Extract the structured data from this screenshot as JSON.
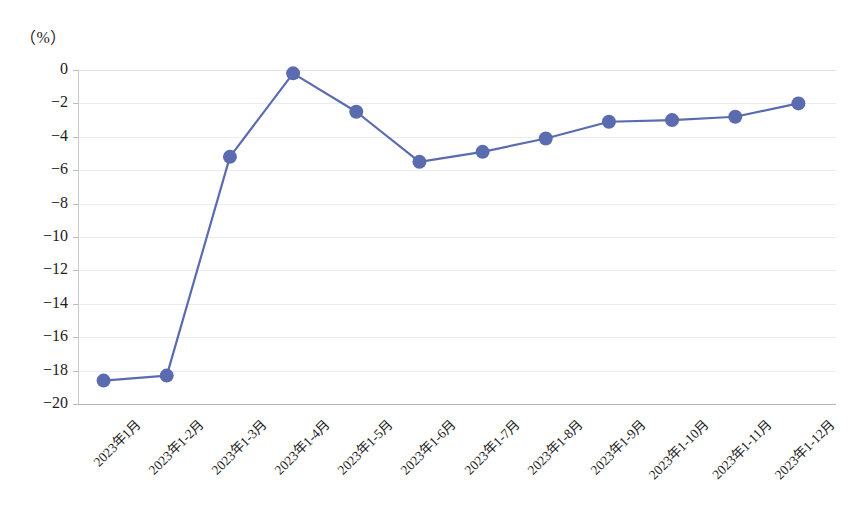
{
  "chart_data": {
    "type": "line",
    "title": "",
    "unit_label": "（%）",
    "xlabel": "",
    "ylabel": "",
    "ylim": [
      -20,
      0
    ],
    "ytick_step": 2,
    "grid": true,
    "legend": null,
    "series_color": "#5b6bb0",
    "categories": [
      "2023年1月",
      "2023年1-2月",
      "2023年1-3月",
      "2023年1-4月",
      "2023年1-5月",
      "2023年1-6月",
      "2023年1-7月",
      "2023年1-8月",
      "2023年1-9月",
      "2023年1-10月",
      "2023年1-11月",
      "2023年1-12月"
    ],
    "values": [
      -18.6,
      -18.3,
      -5.2,
      -0.2,
      -2.5,
      -5.5,
      -4.9,
      -4.1,
      -3.1,
      -3.0,
      -2.8,
      -2.0
    ],
    "ytick_labels": [
      "0",
      "−2",
      "−4",
      "−6",
      "−8",
      "−10",
      "−12",
      "−14",
      "−16",
      "−18",
      "−20"
    ]
  },
  "caption": ""
}
